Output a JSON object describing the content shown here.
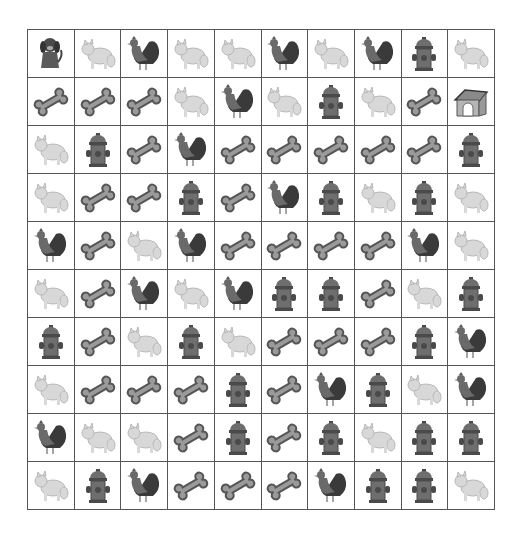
{
  "game": {
    "type": "grid-puzzle",
    "rows": 10,
    "cols": 10,
    "colors": {
      "grid_line": "#555555",
      "background": "#ffffff",
      "bone_fill": "#9a9a9a",
      "bone_stroke": "#555555",
      "hydrant_fill": "#6e6e6e",
      "hydrant_dark": "#4a4a4a",
      "cat_fill": "#d8d8d8",
      "rooster_dark": "#3a3a3a",
      "rooster_mid": "#6a6a6a"
    },
    "legend": {
      "dog": "dog",
      "cat": "cat",
      "rooster": "rooster",
      "bone": "bone",
      "hydrant": "fire-hydrant",
      "doghouse": "doghouse"
    },
    "grid": [
      [
        "dog",
        "cat",
        "rooster",
        "cat",
        "cat",
        "rooster",
        "cat",
        "rooster",
        "hydrant",
        "cat"
      ],
      [
        "bone",
        "bone",
        "bone",
        "cat",
        "rooster",
        "cat",
        "hydrant",
        "cat",
        "bone",
        "doghouse"
      ],
      [
        "cat",
        "hydrant",
        "bone",
        "rooster",
        "bone",
        "bone",
        "bone",
        "bone",
        "bone",
        "hydrant"
      ],
      [
        "cat",
        "bone",
        "bone",
        "hydrant",
        "bone",
        "rooster",
        "hydrant",
        "cat",
        "hydrant",
        "cat"
      ],
      [
        "rooster",
        "bone",
        "cat",
        "rooster",
        "bone",
        "bone",
        "bone",
        "bone",
        "rooster",
        "cat"
      ],
      [
        "cat",
        "bone",
        "rooster",
        "cat",
        "rooster",
        "hydrant",
        "hydrant",
        "bone",
        "cat",
        "hydrant"
      ],
      [
        "hydrant",
        "bone",
        "cat",
        "hydrant",
        "cat",
        "bone",
        "bone",
        "bone",
        "hydrant",
        "rooster"
      ],
      [
        "cat",
        "bone",
        "bone",
        "bone",
        "hydrant",
        "bone",
        "rooster",
        "hydrant",
        "cat",
        "rooster"
      ],
      [
        "rooster",
        "cat",
        "cat",
        "bone",
        "hydrant",
        "bone",
        "hydrant",
        "cat",
        "hydrant",
        "hydrant"
      ],
      [
        "cat",
        "hydrant",
        "rooster",
        "bone",
        "bone",
        "bone",
        "rooster",
        "hydrant",
        "hydrant",
        "cat"
      ]
    ]
  }
}
